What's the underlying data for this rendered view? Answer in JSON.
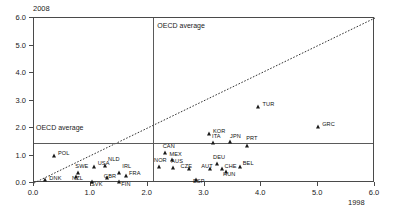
{
  "chart_data": {
    "type": "scatter",
    "title": "",
    "xlabel": "1998",
    "ylabel": "2008",
    "xlim": [
      0.0,
      6.0
    ],
    "ylim": [
      0.0,
      6.0
    ],
    "xticks": [
      "0.0",
      "1.0",
      "2.0",
      "3.0",
      "4.0",
      "5.0",
      "6.0"
    ],
    "xtick_values": [
      0.0,
      1.0,
      2.0,
      3.0,
      4.0,
      5.0,
      6.0
    ],
    "yticks": [
      "0.0",
      "1.0",
      "2.0",
      "3.0",
      "4.0",
      "5.0",
      "6.0"
    ],
    "ytick_values": [
      0.0,
      1.0,
      2.0,
      3.0,
      4.0,
      5.0,
      6.0
    ],
    "grid": false,
    "legend": "none",
    "reference_lines": [
      {
        "name": "oecd-average-vertical",
        "orientation": "vertical",
        "value": 2.1,
        "label": "OECD average"
      },
      {
        "name": "oecd-average-horizontal",
        "orientation": "horizontal",
        "value": 1.45,
        "label": "OECD average"
      },
      {
        "name": "diagonal-45-degree",
        "orientation": "diagonal",
        "style": "dotted",
        "from": [
          0.0,
          0.0
        ],
        "to": [
          6.0,
          6.0
        ]
      }
    ],
    "points": [
      {
        "label": "DNK",
        "x": 0.2,
        "y": 0.12,
        "label_dx": 4,
        "label_dy": 1
      },
      {
        "label": "POL",
        "x": 0.35,
        "y": 1.0,
        "label_dx": 4,
        "label_dy": 0
      },
      {
        "label": "SWE",
        "x": 0.78,
        "y": 0.36,
        "label_dx": -3,
        "label_dy": -4
      },
      {
        "label": "NZL",
        "x": 0.74,
        "y": 0.22,
        "label_dx": -4,
        "label_dy": 4
      },
      {
        "label": "USA",
        "x": 1.05,
        "y": 0.58,
        "label_dx": 4,
        "label_dy": -1
      },
      {
        "label": "NLD",
        "x": 1.25,
        "y": 0.62,
        "label_dx": 3,
        "label_dy": -4
      },
      {
        "label": "SVK",
        "x": 1.02,
        "y": 0.05,
        "label_dx": -1,
        "label_dy": 5
      },
      {
        "label": "GBR",
        "x": 1.28,
        "y": 0.2,
        "label_dx": -3,
        "label_dy": 1
      },
      {
        "label": "IRL",
        "x": 1.5,
        "y": 0.36,
        "label_dx": 3,
        "label_dy": -4
      },
      {
        "label": "FRA",
        "x": 1.62,
        "y": 0.25,
        "label_dx": 3,
        "label_dy": 0
      },
      {
        "label": "FIN",
        "x": 1.5,
        "y": 0.05,
        "label_dx": 2,
        "label_dy": 5
      },
      {
        "label": "NOR",
        "x": 2.2,
        "y": 0.58,
        "label_dx": -5,
        "label_dy": -4
      },
      {
        "label": "CAN",
        "x": 2.3,
        "y": 1.08,
        "label_dx": -2,
        "label_dy": -4
      },
      {
        "label": "MEX",
        "x": 2.42,
        "y": 0.85,
        "label_dx": -2,
        "label_dy": -3
      },
      {
        "label": "AUS",
        "x": 2.45,
        "y": 0.55,
        "label_dx": -2,
        "label_dy": -4
      },
      {
        "label": "CZE",
        "x": 2.72,
        "y": 0.5,
        "label_dx": -8,
        "label_dy": 0
      },
      {
        "label": "ESP",
        "x": 2.85,
        "y": 0.1,
        "label_dx": -3,
        "label_dy": 4
      },
      {
        "label": "AUT",
        "x": 3.1,
        "y": 0.52,
        "label_dx": -9,
        "label_dy": 0
      },
      {
        "label": "DEU",
        "x": 3.22,
        "y": 0.7,
        "label_dx": -4,
        "label_dy": -4
      },
      {
        "label": "CHE",
        "x": 3.3,
        "y": 0.52,
        "label_dx": 3,
        "label_dy": 0
      },
      {
        "label": "HUN",
        "x": 3.38,
        "y": 0.4,
        "label_dx": -3,
        "label_dy": 5
      },
      {
        "label": "ITA",
        "x": 3.15,
        "y": 1.45,
        "label_dx": -1,
        "label_dy": -4
      },
      {
        "label": "JPN",
        "x": 3.45,
        "y": 1.48,
        "label_dx": 0,
        "label_dy": -3
      },
      {
        "label": "PRT",
        "x": 3.75,
        "y": 1.35,
        "label_dx": -1,
        "label_dy": -5
      },
      {
        "label": "BEL",
        "x": 3.62,
        "y": 0.6,
        "label_dx": 3,
        "label_dy": -1
      },
      {
        "label": "KOR",
        "x": 3.08,
        "y": 1.78,
        "label_dx": 4,
        "label_dy": 0
      },
      {
        "label": "TUR",
        "x": 3.95,
        "y": 2.75,
        "label_dx": 4,
        "label_dy": 0
      },
      {
        "label": "GRC",
        "x": 5.0,
        "y": 2.02,
        "label_dx": 4,
        "label_dy": 0
      }
    ]
  }
}
